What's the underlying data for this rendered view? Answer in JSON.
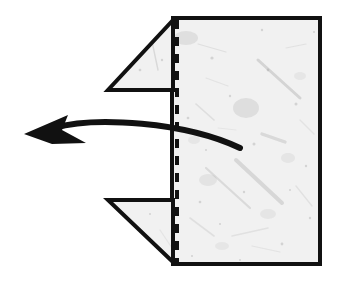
{
  "figure": {
    "background_color": "#ffffff",
    "ink_color": "#111111",
    "paper_fill_color": "#f1f1f1",
    "paper_speckle_color": "#9a9a9a",
    "stroke_width": 4,
    "width": 339,
    "height": 291
  },
  "paper": {
    "name": "folded-paper-sheet",
    "description": "Square sheet of handmade paper with top-left and bottom-left corners folded back, seen from the front",
    "outline_points": "175,18 320,18 320,264 175,264 108,200 172,200 172,90 108,90",
    "top_edge": {
      "from": [
        175,
        18
      ],
      "to": [
        320,
        18
      ]
    },
    "right_edge": {
      "from": [
        320,
        18
      ],
      "to": [
        320,
        264
      ]
    },
    "bottom_edge": {
      "from": [
        320,
        264
      ],
      "to": [
        175,
        264
      ]
    },
    "left_edge": {
      "from": [
        108,
        90
      ],
      "to": [
        108,
        200
      ]
    },
    "top_flap": {
      "name": "top-left-folded-flap",
      "diagonal": {
        "from": [
          175,
          18
        ],
        "to": [
          108,
          90
        ]
      },
      "inner_vertical": {
        "from": [
          173,
          18
        ],
        "to": [
          173,
          90
        ]
      },
      "horizontal": {
        "from": [
          108,
          90
        ],
        "to": [
          173,
          90
        ]
      }
    },
    "bottom_flap": {
      "name": "bottom-left-folded-flap",
      "diagonal": {
        "from": [
          108,
          200
        ],
        "to": [
          175,
          264
        ]
      },
      "inner_vertical": {
        "from": [
          173,
          200
        ],
        "to": [
          173,
          264
        ]
      },
      "horizontal": {
        "from": [
          108,
          200
        ],
        "to": [
          173,
          200
        ]
      }
    }
  },
  "crease": {
    "name": "vertical-crease-dashed-line",
    "label": "hidden fold crease",
    "x": 177,
    "y_start": 20,
    "y_end": 263,
    "dash_length": 9,
    "gap_length": 8,
    "stroke_width": 4,
    "color": "#111111"
  },
  "arrow": {
    "name": "fold-direction-arrow",
    "label": "fold to the left",
    "direction": "left",
    "tail": [
      240,
      148
    ],
    "tip": [
      24,
      134
    ],
    "control_1": [
      185,
      122
    ],
    "control_2": [
      95,
      116
    ],
    "head_points": "24,134 68,115 62,130 86,143 52,144",
    "stroke_width": 6,
    "color": "#111111"
  },
  "texture": {
    "name": "paper-fiber-texture",
    "fibers": [
      {
        "x1": 258,
        "y1": 60,
        "x2": 300,
        "y2": 98,
        "w": 3.0,
        "o": 0.34
      },
      {
        "x1": 236,
        "y1": 160,
        "x2": 282,
        "y2": 203,
        "w": 4.0,
        "o": 0.3
      },
      {
        "x1": 206,
        "y1": 168,
        "x2": 250,
        "y2": 208,
        "w": 2.2,
        "o": 0.26
      },
      {
        "x1": 262,
        "y1": 134,
        "x2": 285,
        "y2": 142,
        "w": 3.4,
        "o": 0.28
      },
      {
        "x1": 196,
        "y1": 104,
        "x2": 214,
        "y2": 120,
        "w": 1.6,
        "o": 0.22
      },
      {
        "x1": 150,
        "y1": 32,
        "x2": 158,
        "y2": 70,
        "w": 1.4,
        "o": 0.28
      },
      {
        "x1": 198,
        "y1": 44,
        "x2": 226,
        "y2": 52,
        "w": 1.2,
        "o": 0.2
      },
      {
        "x1": 286,
        "y1": 48,
        "x2": 306,
        "y2": 44,
        "w": 1.2,
        "o": 0.18
      },
      {
        "x1": 190,
        "y1": 218,
        "x2": 214,
        "y2": 236,
        "w": 1.6,
        "o": 0.2
      },
      {
        "x1": 232,
        "y1": 236,
        "x2": 268,
        "y2": 228,
        "w": 1.4,
        "o": 0.18
      },
      {
        "x1": 128,
        "y1": 150,
        "x2": 146,
        "y2": 172,
        "w": 1.3,
        "o": 0.2
      },
      {
        "x1": 118,
        "y1": 106,
        "x2": 134,
        "y2": 118,
        "w": 1.2,
        "o": 0.18
      },
      {
        "x1": 296,
        "y1": 186,
        "x2": 312,
        "y2": 206,
        "w": 1.4,
        "o": 0.18
      },
      {
        "x1": 206,
        "y1": 78,
        "x2": 228,
        "y2": 86,
        "w": 1.1,
        "o": 0.16
      },
      {
        "x1": 252,
        "y1": 246,
        "x2": 280,
        "y2": 252,
        "w": 1.2,
        "o": 0.16
      },
      {
        "x1": 160,
        "y1": 230,
        "x2": 172,
        "y2": 248,
        "w": 1.1,
        "o": 0.16
      },
      {
        "x1": 300,
        "y1": 120,
        "x2": 314,
        "y2": 134,
        "w": 1.2,
        "o": 0.16
      },
      {
        "x1": 218,
        "y1": 128,
        "x2": 236,
        "y2": 130,
        "w": 1.0,
        "o": 0.14
      }
    ],
    "blots": [
      {
        "cx": 246,
        "cy": 108,
        "rx": 13,
        "ry": 10,
        "o": 0.22
      },
      {
        "cx": 132,
        "cy": 126,
        "rx": 11,
        "ry": 8,
        "o": 0.2
      },
      {
        "cx": 186,
        "cy": 38,
        "rx": 12,
        "ry": 7,
        "o": 0.2
      },
      {
        "cx": 208,
        "cy": 180,
        "rx": 9,
        "ry": 6,
        "o": 0.16
      },
      {
        "cx": 288,
        "cy": 158,
        "rx": 7,
        "ry": 5,
        "o": 0.14
      },
      {
        "cx": 150,
        "cy": 176,
        "rx": 7,
        "ry": 5,
        "o": 0.13
      },
      {
        "cx": 268,
        "cy": 214,
        "rx": 8,
        "ry": 5,
        "o": 0.13
      },
      {
        "cx": 222,
        "cy": 246,
        "rx": 7,
        "ry": 4,
        "o": 0.12
      },
      {
        "cx": 300,
        "cy": 76,
        "rx": 6,
        "ry": 4,
        "o": 0.12
      },
      {
        "cx": 194,
        "cy": 140,
        "rx": 6,
        "ry": 4,
        "o": 0.12
      }
    ],
    "specks": [
      {
        "cx": 212,
        "cy": 58,
        "r": 1.6
      },
      {
        "cx": 268,
        "cy": 70,
        "r": 1.4
      },
      {
        "cx": 296,
        "cy": 104,
        "r": 1.5
      },
      {
        "cx": 230,
        "cy": 96,
        "r": 1.2
      },
      {
        "cx": 188,
        "cy": 118,
        "r": 1.3
      },
      {
        "cx": 254,
        "cy": 144,
        "r": 1.5
      },
      {
        "cx": 200,
        "cy": 202,
        "r": 1.3
      },
      {
        "cx": 244,
        "cy": 192,
        "r": 1.2
      },
      {
        "cx": 282,
        "cy": 244,
        "r": 1.4
      },
      {
        "cx": 310,
        "cy": 218,
        "r": 1.2
      },
      {
        "cx": 136,
        "cy": 192,
        "r": 1.2
      },
      {
        "cx": 120,
        "cy": 168,
        "r": 1.1
      },
      {
        "cx": 162,
        "cy": 60,
        "r": 1.2
      },
      {
        "cx": 140,
        "cy": 70,
        "r": 1.3
      },
      {
        "cx": 306,
        "cy": 166,
        "r": 1.2
      },
      {
        "cx": 220,
        "cy": 224,
        "r": 1.1
      },
      {
        "cx": 176,
        "cy": 96,
        "r": 1.1
      },
      {
        "cx": 262,
        "cy": 30,
        "r": 1.2
      },
      {
        "cx": 314,
        "cy": 32,
        "r": 1.1
      },
      {
        "cx": 192,
        "cy": 256,
        "r": 1.1
      },
      {
        "cx": 240,
        "cy": 260,
        "r": 1.0
      },
      {
        "cx": 290,
        "cy": 190,
        "r": 1.0
      },
      {
        "cx": 150,
        "cy": 214,
        "r": 1.0
      },
      {
        "cx": 206,
        "cy": 150,
        "r": 1.0
      }
    ]
  }
}
